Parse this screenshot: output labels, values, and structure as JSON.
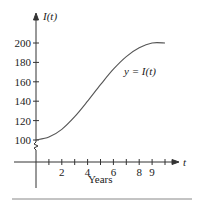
{
  "chart_data": {
    "type": "line",
    "title": "",
    "xlabel": "Years",
    "ylabel": "I(t)",
    "x_axis_symbol": "t",
    "curve_label": "y = I(t)",
    "x_tick_labels": [
      "2",
      "4",
      "6",
      "8",
      "9"
    ],
    "x_tick_values": [
      2,
      4,
      6,
      8,
      9
    ],
    "x_minor_ticks": [
      1,
      2,
      3,
      4,
      5,
      6,
      7,
      8,
      9,
      10
    ],
    "y_tick_labels": [
      "100",
      "120",
      "140",
      "160",
      "180",
      "200"
    ],
    "y_tick_values": [
      100,
      120,
      140,
      160,
      180,
      200
    ],
    "xlim": [
      0,
      11
    ],
    "ylim": [
      100,
      210
    ],
    "y_axis_break": true,
    "grid": false,
    "legend": "none",
    "x": [
      0,
      1,
      2,
      3,
      4,
      5,
      6,
      7,
      8,
      9,
      10
    ],
    "series": [
      {
        "name": "I(t)",
        "values": [
          100,
          103,
          111,
          124,
          140,
          157,
          173,
          186,
          195,
          200,
          200
        ]
      }
    ]
  }
}
